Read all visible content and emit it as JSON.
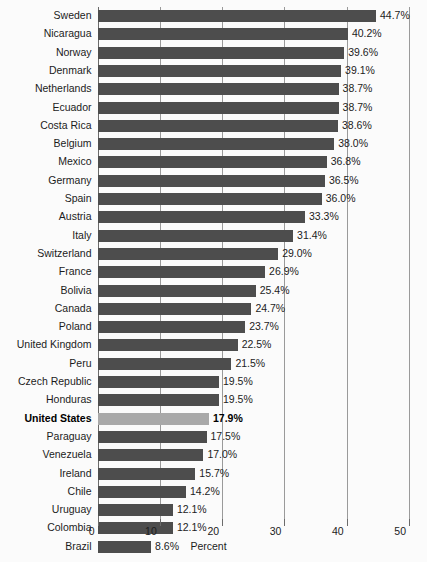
{
  "chart_data": {
    "type": "bar",
    "orientation": "horizontal",
    "title": "",
    "xlabel": "Percent",
    "ylabel": "",
    "xlim": [
      0,
      50
    ],
    "xticks": [
      0,
      10,
      20,
      30,
      40,
      50
    ],
    "xtick_labels": [
      "0",
      "10",
      "20",
      "30",
      "40",
      "50"
    ],
    "grid": true,
    "legend": "none",
    "value_label_suffix": "%",
    "categories": [
      "Sweden",
      "Nicaragua",
      "Norway",
      "Denmark",
      "Netherlands",
      "Ecuador",
      "Costa Rica",
      "Belgium",
      "Mexico",
      "Germany",
      "Spain",
      "Austria",
      "Italy",
      "Switzerland",
      "France",
      "Bolivia",
      "Canada",
      "Poland",
      "United Kingdom",
      "Peru",
      "Czech Republic",
      "Honduras",
      "United States",
      "Paraguay",
      "Venezuela",
      "Ireland",
      "Chile",
      "Uruguay",
      "Colombia",
      "Brazil"
    ],
    "values": [
      44.7,
      40.2,
      39.6,
      39.1,
      38.7,
      38.7,
      38.6,
      38.0,
      36.8,
      36.5,
      36.0,
      33.3,
      31.4,
      29.0,
      26.9,
      25.4,
      24.7,
      23.7,
      22.5,
      21.5,
      19.5,
      19.5,
      17.9,
      17.5,
      17.0,
      15.7,
      14.2,
      12.1,
      12.1,
      8.6
    ],
    "value_labels": [
      "44.7%",
      "40.2%",
      "39.6%",
      "39.1%",
      "38.7%",
      "38.7%",
      "38.6%",
      "38.0%",
      "36.8%",
      "36.5%",
      "36.0%",
      "33.3%",
      "31.4%",
      "29.0%",
      "26.9%",
      "25.4%",
      "24.7%",
      "23.7%",
      "22.5%",
      "21.5%",
      "19.5%",
      "19.5%",
      "17.9%",
      "17.5%",
      "17.0%",
      "15.7%",
      "14.2%",
      "12.1%",
      "12.1%",
      "8.6%"
    ],
    "highlighted_category": "United States",
    "colors": {
      "bar": "#4d4d4d",
      "bar_highlight": "#a9a9a9",
      "gridline": "#9a9a9a",
      "axis": "#6b6b6b",
      "text": "#1c1c1c",
      "background": "#fbfbfb"
    }
  }
}
